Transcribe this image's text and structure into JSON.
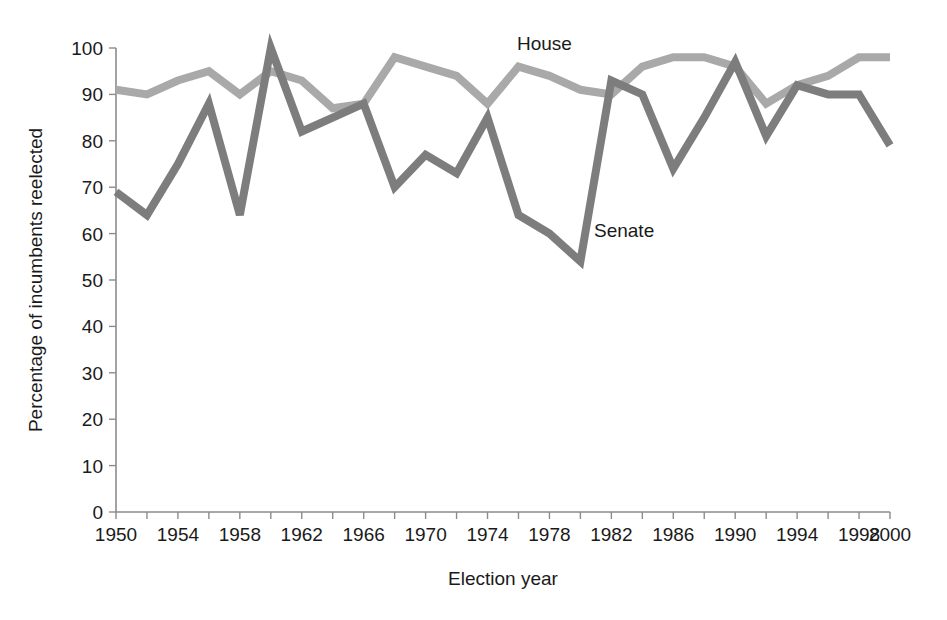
{
  "chart_data": {
    "type": "line",
    "title": "",
    "xlabel": "Election year",
    "ylabel": "Percentage of incumbents reelected",
    "xlim": [
      1950,
      2000
    ],
    "ylim": [
      0,
      100
    ],
    "grid": false,
    "legend_position": "inline-annotation",
    "x_tick_interval": 2,
    "x_label_interval": 4,
    "y_tick_interval": 10,
    "x_tick_labels": [
      "1950",
      "1954",
      "1958",
      "1962",
      "1966",
      "1970",
      "1974",
      "1978",
      "1982",
      "1986",
      "1990",
      "1994",
      "1998",
      "2000"
    ],
    "y_tick_labels": [
      "0",
      "10",
      "20",
      "30",
      "40",
      "50",
      "60",
      "70",
      "80",
      "90",
      "100"
    ],
    "x": [
      1950,
      1952,
      1954,
      1956,
      1958,
      1960,
      1962,
      1964,
      1966,
      1968,
      1970,
      1972,
      1974,
      1976,
      1978,
      1980,
      1982,
      1984,
      1986,
      1988,
      1990,
      1992,
      1994,
      1996,
      1998,
      2000
    ],
    "series": [
      {
        "name": "House",
        "color": "#a9a9a9",
        "label_text": "House",
        "values": [
          91,
          90,
          93,
          95,
          90,
          95,
          93,
          87,
          88,
          98,
          96,
          94,
          88,
          96,
          94,
          91,
          90,
          96,
          98,
          98,
          96,
          88,
          92,
          94,
          98,
          98
        ]
      },
      {
        "name": "Senate",
        "color": "#7d7d7d",
        "label_text": "Senate",
        "values": [
          69,
          64,
          75,
          88,
          64,
          100,
          82,
          85,
          88,
          70,
          77,
          73,
          85,
          64,
          60,
          54,
          93,
          90,
          74,
          85,
          97,
          81,
          92,
          90,
          90,
          79
        ]
      }
    ],
    "annotations": [
      {
        "text": "House",
        "series": "House"
      },
      {
        "text": "Senate",
        "series": "Senate"
      }
    ]
  },
  "plot_geometry": {
    "left": 116,
    "right": 890,
    "top": 48,
    "bottom": 512
  },
  "labels": {
    "house": "House",
    "senate": "Senate",
    "x_axis_title": "Election year",
    "y_axis_title": "Percentage of incumbents reelected"
  }
}
